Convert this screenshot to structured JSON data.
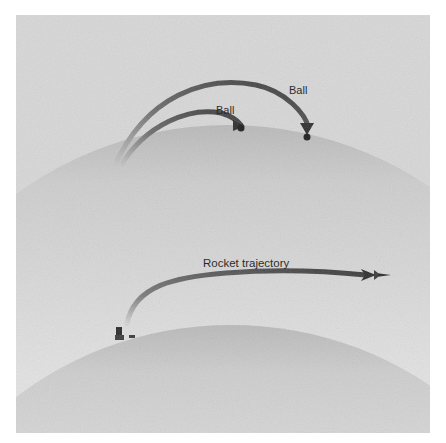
{
  "figure": {
    "panels": [
      {
        "id": "top",
        "description": "Balls thrown from Earth's surface fall back to the ground",
        "labels": [
          {
            "text": "Ball"
          },
          {
            "text": "Ball"
          }
        ]
      },
      {
        "id": "bottom",
        "description": "Rocket launched fast enough to continue along its trajectory",
        "labels": [
          {
            "text": "Rocket trajectory"
          }
        ]
      }
    ]
  },
  "colors": {
    "background": "#d6d6d6",
    "earth_light": "#e6e6e6",
    "earth_dark": "#a9a9a9",
    "arrow": "#3a3a3a",
    "text": "#1a1a1a"
  }
}
